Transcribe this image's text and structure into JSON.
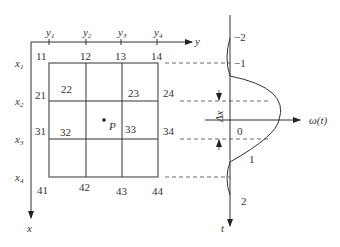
{
  "diagram": {
    "grid": {
      "axis_labels": {
        "x": "x",
        "y": "y"
      },
      "column_ticks": [
        {
          "label": "y",
          "sub": "1"
        },
        {
          "label": "y",
          "sub": "2"
        },
        {
          "label": "y",
          "sub": "3"
        },
        {
          "label": "y",
          "sub": "4"
        }
      ],
      "row_ticks": [
        {
          "label": "x",
          "sub": "1"
        },
        {
          "label": "x",
          "sub": "2"
        },
        {
          "label": "x",
          "sub": "3"
        },
        {
          "label": "x",
          "sub": "4"
        }
      ],
      "node_labels": {
        "n11": "11",
        "n12": "12",
        "n13": "13",
        "n14": "14",
        "n21": "21",
        "n22": "22",
        "n23": "23",
        "n24": "24",
        "n31": "31",
        "n32": "32",
        "n33": "33",
        "n34": "34",
        "n41": "41",
        "n42": "42",
        "n43": "43",
        "n44": "44"
      },
      "point": {
        "label": "P"
      }
    },
    "weight_plot": {
      "horizontal_axis_label": "ω(t)",
      "vertical_axis_label": "t",
      "t_ticks": [
        "−2",
        "−1",
        "0",
        "1",
        "2"
      ],
      "delta_label": "Δx"
    },
    "colors": {
      "line": "#333333",
      "background": "#ffffff"
    }
  }
}
